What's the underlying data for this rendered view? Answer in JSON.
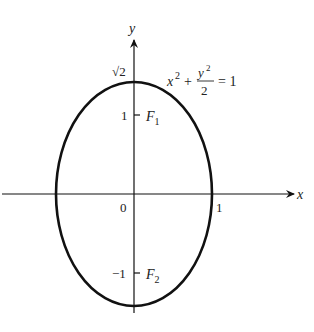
{
  "figure": {
    "header_fragment": "",
    "axes": {
      "x_label": "x",
      "y_label": "y",
      "origin_label": "0",
      "x_tick_label": "1",
      "y_tick_top_label": "1",
      "y_tick_bottom_label": "−1",
      "y_intercept_label": "√2"
    },
    "foci": {
      "f1": {
        "letter": "F",
        "sub": "1"
      },
      "f2": {
        "letter": "F",
        "sub": "2"
      }
    },
    "equation": {
      "lhs": "x",
      "lhs_exp": "2",
      "plus": "+",
      "frac_num": "y",
      "frac_num_exp": "2",
      "frac_den": "2",
      "rhs": "= 1"
    },
    "colors": {
      "stroke": "#111111",
      "text": "#222222"
    }
  }
}
